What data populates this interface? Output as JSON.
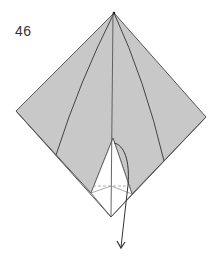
{
  "step": {
    "number": "46"
  },
  "colors": {
    "paper_colored": "#c8c8c8",
    "paper_white": "#ffffff",
    "line": "#555555",
    "hidden_line": "#999999",
    "arrow": "#333333"
  },
  "diagram": {
    "points": {
      "top": [
        114,
        13
      ],
      "left": [
        16,
        111
      ],
      "right": [
        206,
        117
      ],
      "bottom": [
        111,
        217
      ],
      "flap_top": [
        113,
        138
      ],
      "flap_left": [
        91,
        193
      ],
      "flap_right": [
        132,
        194
      ]
    }
  }
}
